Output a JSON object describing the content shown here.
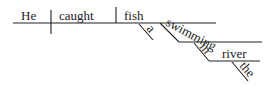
{
  "diagram": {
    "type": "sentence-diagram",
    "sentence": "He caught a fish swimming in the river",
    "words": {
      "subject": "He",
      "verb": "caught",
      "object": "fish",
      "object_modifier": "a",
      "participle": "swimming",
      "preposition": "in",
      "prep_object": "river",
      "prep_object_modifier": "the"
    },
    "colors": {
      "ink": "#222222",
      "background": "#ffffff"
    }
  }
}
